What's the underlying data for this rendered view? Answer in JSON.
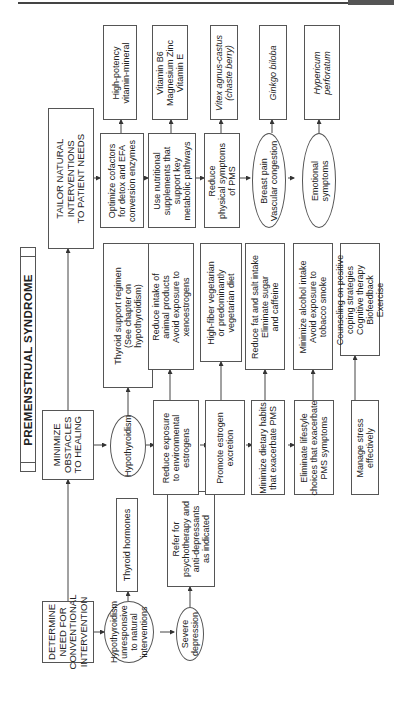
{
  "title": "PREMENSTRUAL SYNDROME",
  "stages": {
    "determine": "DETERMINE\nNEED FOR\nCONVENTIONAL\nINTERVENTION",
    "minimize": "MINIMIZE\nOBSTACLES\nTO HEALING",
    "tailor": "TAILOR NATURAL\nINTERVENTIONS\nTO PATIENT NEEDS"
  },
  "determine_branch": {
    "hypo_unresponsive": "Hypothyroidism\nunresponsive\nto natural\ninterventions",
    "thyroid_hormones": "Thyroid hormones",
    "severe_depression": "Severe\ndepression",
    "refer": "Refer for\npsychotherapy and\nanti-depressants\nas indicated"
  },
  "minimize_branch": {
    "hypothyroidism": "Hypothyroidism",
    "thyroid_support": "Thyroid support regimen\n(See chapter on\nhypothyroidism)",
    "reduce_exposure": "Reduce exposure\nto environmental\nestrogens",
    "reduce_intake": "Reduce intake of\nanimal products\nAvoid exposure to\nxenoestrogens",
    "promote_excretion": "Promote estrogen\nexcretion",
    "high_fiber": "High-fiber vegetarian\nor predominantly\nvegetarian diet",
    "minimize_diet": "Minimize dietary habits\nthat exacerbate PMS",
    "reduce_fat": "Reduce fat and salt intake\nEliminate sugar\nand caffeine",
    "eliminate_lifestyle": "Eliminate lifestyle\nchoices that exacerbate\nPMS symptoms",
    "minimize_alcohol": "Minimize alcohol intake\nAvoid exposure to\ntobacco smoke",
    "manage_stress": "Manage stress\neffectively",
    "counseling": "Counseling on positive\ncoping strategies\nCognitive therapy\nBiofeedback\nExercise"
  },
  "tailor_branch": {
    "optimize": "Optimize cofactors\nfor detox and EFA\nconversion enzymes",
    "high_potency": "High-potency\nvitamin-mineral",
    "use_nutritional": "Use nutritional\nsupplements that\nsupport key\nmetabolic pathways",
    "vitamins": "Vitamin B6\nMagnesium Zinc\nVitamin E",
    "reduce_physical": "Reduce\nphysical symptoms\nof PMS",
    "vitex": "Vitex agnus-castus\n(chaste berry)",
    "breast_pain": "Breast pain\nVascular congestion",
    "ginkgo": "Ginkgo biloba",
    "emotional": "Emotional\nsymptoms",
    "hypericum": "Hypericum\nperforatum"
  }
}
